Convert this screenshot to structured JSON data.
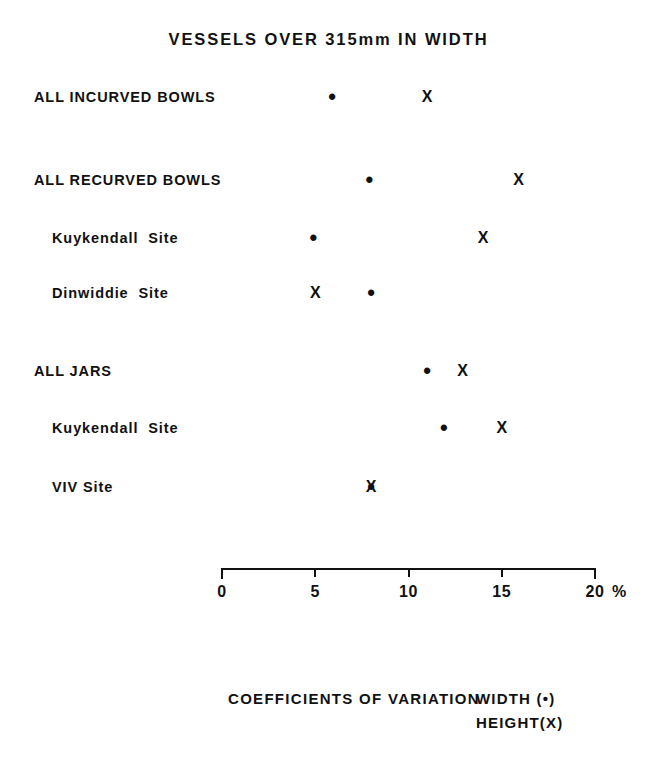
{
  "title": "VESSELS OVER 315mm IN WIDTH",
  "caption": {
    "main": "COEFFICIENTS OF VARIATION",
    "legend_width": "WIDTH (•)",
    "legend_height": "HEIGHT(X)"
  },
  "axis": {
    "unit": "%",
    "tick_labels": [
      "0",
      "5",
      "10",
      "15",
      "20"
    ]
  },
  "rows": [
    {
      "label": "ALL INCURVED BOWLS",
      "indent": 0
    },
    {
      "label": "ALL RECURVED BOWLS",
      "indent": 0
    },
    {
      "label": "Kuykendall  Site",
      "indent": 1
    },
    {
      "label": "Dinwiddie  Site",
      "indent": 1
    },
    {
      "label": "ALL JARS",
      "indent": 0
    },
    {
      "label": "Kuykendall  Site",
      "indent": 1
    },
    {
      "label": "VIV Site",
      "indent": 1
    }
  ],
  "chart_data": {
    "type": "scatter",
    "title": "VESSELS OVER 315mm IN WIDTH",
    "xlabel": "COEFFICIENTS OF VARIATION",
    "ylabel": "",
    "xlim": [
      0,
      20
    ],
    "xticks": [
      0,
      5,
      10,
      15,
      20
    ],
    "xtick_labels": [
      "0",
      "5",
      "10",
      "15",
      "20"
    ],
    "x_unit": "%",
    "grid": false,
    "legend_position": "bottom-right",
    "categories": [
      "ALL INCURVED BOWLS",
      "ALL RECURVED BOWLS",
      "Kuykendall  Site",
      "Dinwiddie  Site",
      "ALL JARS",
      "Kuykendall  Site",
      "VIV Site"
    ],
    "series": [
      {
        "name": "WIDTH (•)",
        "marker": "dot",
        "values": [
          5.9,
          7.9,
          4.9,
          8.0,
          11.0,
          11.9,
          8.0
        ]
      },
      {
        "name": "HEIGHT(X)",
        "marker": "x",
        "values": [
          11.0,
          15.9,
          14.0,
          5.0,
          12.9,
          15.0,
          8.0
        ]
      }
    ]
  },
  "geometry": {
    "axis_x0_px": 222,
    "axis_x20_px": 595,
    "row_y_px": [
      97,
      180,
      238,
      293,
      371,
      428,
      487
    ]
  }
}
